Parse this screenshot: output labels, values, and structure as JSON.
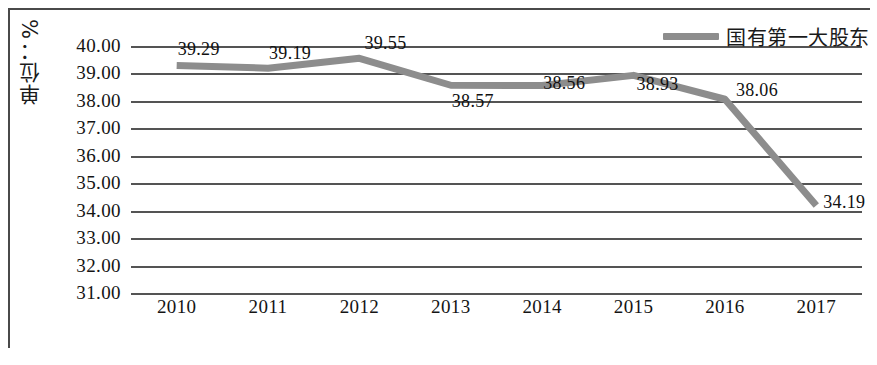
{
  "chart_data": {
    "type": "line",
    "title": "",
    "xlabel": "",
    "ylabel": "单位：%",
    "categories": [
      "2010",
      "2011",
      "2012",
      "2013",
      "2014",
      "2015",
      "2016",
      "2017"
    ],
    "series": [
      {
        "name": "国有第一大股东",
        "values": [
          39.29,
          39.19,
          39.55,
          38.57,
          38.56,
          38.93,
          38.06,
          34.19
        ],
        "color": "#8d8d8d"
      }
    ],
    "ylim": [
      31.0,
      40.0
    ],
    "ytick_labels": [
      "40.00",
      "39.00",
      "38.00",
      "37.00",
      "36.00",
      "35.00",
      "34.00",
      "33.00",
      "32.00",
      "31.00"
    ],
    "ytick_values": [
      40,
      39,
      38,
      37,
      36,
      35,
      34,
      33,
      32,
      31
    ],
    "data_labels": [
      "39.29",
      "39.19",
      "39.55",
      "38.57",
      "38.56",
      "38.93",
      "38.06",
      "34.19"
    ],
    "grid": true,
    "grid_color": "#545454",
    "legend_position": "top-right",
    "frame_color": "#4a4a4a"
  },
  "legend": {
    "entries": [
      {
        "label": "国有第一大股东",
        "color": "#8d8d8d"
      }
    ]
  },
  "axes": {
    "y_title": "单位：%"
  }
}
